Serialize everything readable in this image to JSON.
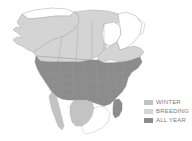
{
  "figure": {
    "kind": "species-range-map",
    "region": "North America",
    "background_color": "#ffffff"
  },
  "map": {
    "outline_color": "#a8a8a8",
    "internal_border_color": "#9a9a9a",
    "out_of_range_fill": "#ffffff",
    "areas": [
      {
        "name": "alaska",
        "range": "breeding"
      },
      {
        "name": "northern-alaska-coast",
        "range": "none"
      },
      {
        "name": "western-canada",
        "range": "breeding"
      },
      {
        "name": "central-canada",
        "range": "breeding"
      },
      {
        "name": "eastern-canada",
        "range": "breeding"
      },
      {
        "name": "hudson-bay",
        "range": "none"
      },
      {
        "name": "northern-quebec-labrador",
        "range": "none"
      },
      {
        "name": "contiguous-united-states",
        "range": "all-year"
      },
      {
        "name": "florida-peninsula",
        "range": "all-year"
      },
      {
        "name": "baja-california",
        "range": "winter"
      },
      {
        "name": "mexican-highlands",
        "range": "winter"
      },
      {
        "name": "southern-mexico",
        "range": "none"
      }
    ]
  },
  "legend": {
    "items": [
      {
        "label": "WINTER",
        "color": "#c3c3c3",
        "key": "winter"
      },
      {
        "label": "BREEDING",
        "color": "#d4d4d4",
        "key": "breeding"
      },
      {
        "label": "ALL YEAR",
        "color": "#8c8c8c",
        "key": "all-year"
      }
    ],
    "text_color": "#7b7b7b"
  }
}
